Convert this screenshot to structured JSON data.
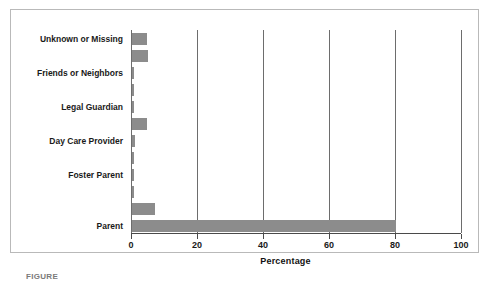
{
  "chart_data": {
    "type": "bar",
    "orientation": "horizontal",
    "title": "",
    "xlabel": "Percentage",
    "ylabel": "",
    "xlim": [
      0,
      100
    ],
    "xticks": [
      0,
      20,
      40,
      60,
      80,
      100
    ],
    "xticklabels": [
      "0",
      "20",
      "40",
      "60",
      "80",
      "100"
    ],
    "grid": "vertical",
    "legend": "none",
    "bar_color": "#8c8c8c",
    "categories": [
      "Unknown or Missing",
      "Friends or Neighbors",
      "Legal Guardian",
      "Day Care Provider",
      "Foster Parent",
      "Parent"
    ],
    "bars": [
      {
        "label": "Unknown or Missing",
        "labeled": true,
        "value": 4.5
      },
      {
        "label": "",
        "labeled": false,
        "value": 4.8
      },
      {
        "label": "Friends or Neighbors",
        "labeled": true,
        "value": 0.6
      },
      {
        "label": "",
        "labeled": false,
        "value": 0.3
      },
      {
        "label": "Legal Guardian",
        "labeled": true,
        "value": 0.3
      },
      {
        "label": "",
        "labeled": false,
        "value": 4.5
      },
      {
        "label": "Day Care Provider",
        "labeled": true,
        "value": 0.8
      },
      {
        "label": "",
        "labeled": false,
        "value": 0.3
      },
      {
        "label": "Foster Parent",
        "labeled": true,
        "value": 0.5
      },
      {
        "label": "",
        "labeled": false,
        "value": 0.3
      },
      {
        "label": "",
        "labeled": false,
        "value": 7.0
      },
      {
        "label": "Parent",
        "labeled": true,
        "value": 80.0
      }
    ],
    "values": [
      4.5,
      0.6,
      0.3,
      0.8,
      0.5,
      80.0
    ]
  },
  "caption": {
    "text": "FIGURE"
  }
}
